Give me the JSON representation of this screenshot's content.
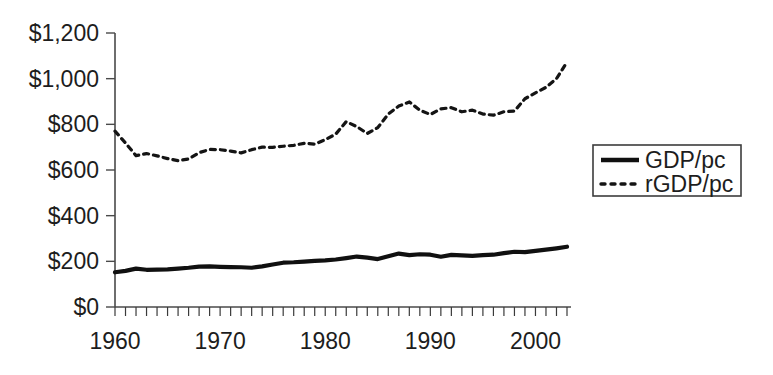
{
  "chart_data": {
    "type": "line",
    "title": "",
    "xlabel": "",
    "ylabel": "",
    "xlim": [
      1960,
      2003
    ],
    "ylim": [
      0,
      1200
    ],
    "grid": false,
    "legend_position": "right",
    "y_tick_labels": [
      "$1,200",
      "$1,000",
      "$800",
      "$600",
      "$400",
      "$200",
      "$0"
    ],
    "y_tick_values": [
      1200,
      1000,
      800,
      600,
      400,
      200,
      0
    ],
    "x_tick_labels": [
      "1960",
      "1970",
      "1980",
      "1990",
      "2000"
    ],
    "x_tick_values": [
      1960,
      1970,
      1980,
      1990,
      2000
    ],
    "x_minor_tick_interval": 1,
    "x": [
      1960,
      1961,
      1962,
      1963,
      1964,
      1965,
      1966,
      1967,
      1968,
      1969,
      1970,
      1971,
      1972,
      1973,
      1974,
      1975,
      1976,
      1977,
      1978,
      1979,
      1980,
      1981,
      1982,
      1983,
      1984,
      1985,
      1986,
      1987,
      1988,
      1989,
      1990,
      1991,
      1992,
      1993,
      1994,
      1995,
      1996,
      1997,
      1998,
      1999,
      2000,
      2001,
      2002,
      2003
    ],
    "series": [
      {
        "name": "GDP/pc",
        "style": "solid",
        "color": "#101010",
        "values": [
          152,
          158,
          168,
          163,
          164,
          165,
          168,
          172,
          177,
          178,
          176,
          175,
          174,
          172,
          178,
          186,
          194,
          196,
          199,
          202,
          204,
          208,
          214,
          221,
          216,
          210,
          222,
          234,
          227,
          231,
          229,
          220,
          228,
          226,
          224,
          227,
          229,
          236,
          242,
          240,
          246,
          251,
          257,
          264
        ]
      },
      {
        "name": "rGDP/pc",
        "style": "dotted",
        "color": "#141414",
        "values": [
          770,
          718,
          663,
          672,
          662,
          650,
          641,
          648,
          676,
          690,
          689,
          683,
          675,
          689,
          700,
          699,
          704,
          708,
          717,
          713,
          733,
          757,
          812,
          790,
          760,
          786,
          845,
          880,
          898,
          862,
          843,
          868,
          873,
          855,
          862,
          845,
          840,
          855,
          858,
          912,
          938,
          962,
          1000,
          1073
        ]
      }
    ]
  },
  "legend": {
    "entries": [
      {
        "label": "GDP/pc",
        "style": "solid"
      },
      {
        "label": "rGDP/pc",
        "style": "dotted"
      }
    ]
  }
}
